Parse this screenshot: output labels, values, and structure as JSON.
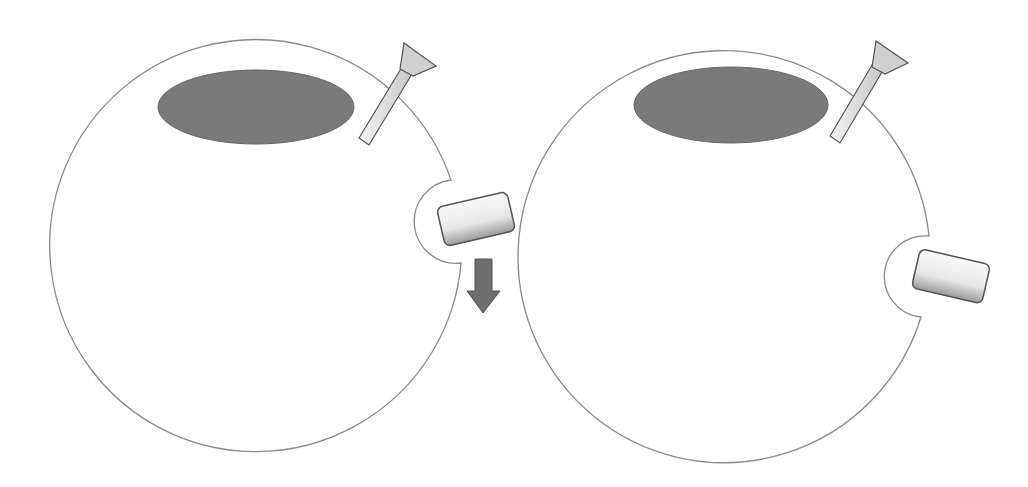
{
  "diagram": {
    "panels": [
      {
        "name": "left-cell",
        "notch": "pocket opening on right side",
        "block_position": "inside notch",
        "arrow": "down-arrow"
      },
      {
        "name": "right-cell",
        "notch": "pocket opening on right side, lower",
        "block_position": "inside notch",
        "arrow": null
      }
    ],
    "colors": {
      "outline": "#8a8a8a",
      "nucleus": "#7a7a7a",
      "arrow": "#6e6e6e",
      "pipette": "#d8d8d8",
      "block": "#e8e8e8"
    }
  }
}
